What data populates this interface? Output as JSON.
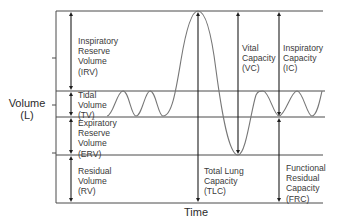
{
  "diagram": {
    "axes": {
      "y_label_line1": "Volume",
      "y_label_line2": "(L)",
      "x_label": "Time"
    },
    "volumes": [
      {
        "id": "irv",
        "label": "Inspiratory\nReserve\nVolume\n(IRV)"
      },
      {
        "id": "tv",
        "label": "Tidal\nVolume\n(TV)"
      },
      {
        "id": "erv",
        "label": "Expiratory\nReserve\nVolume\n(ERV)"
      },
      {
        "id": "rv",
        "label": "Residual\nVolume\n(RV)"
      }
    ],
    "capacities": [
      {
        "id": "tlc",
        "label": "Total Lung\nCapacity\n(TLC)"
      },
      {
        "id": "vc",
        "label": "Vital\nCapacity\n(VC)"
      },
      {
        "id": "ic",
        "label": "Inspiratory\nCapacity\n(IC)"
      },
      {
        "id": "frc",
        "label": "Functional\nResidual\nCapacity\n(FRC)"
      }
    ],
    "colors": {
      "line": "#4a4a4a",
      "wave": "#777777",
      "arrow": "#1e1e1e",
      "text": "#3a3a3a"
    }
  }
}
